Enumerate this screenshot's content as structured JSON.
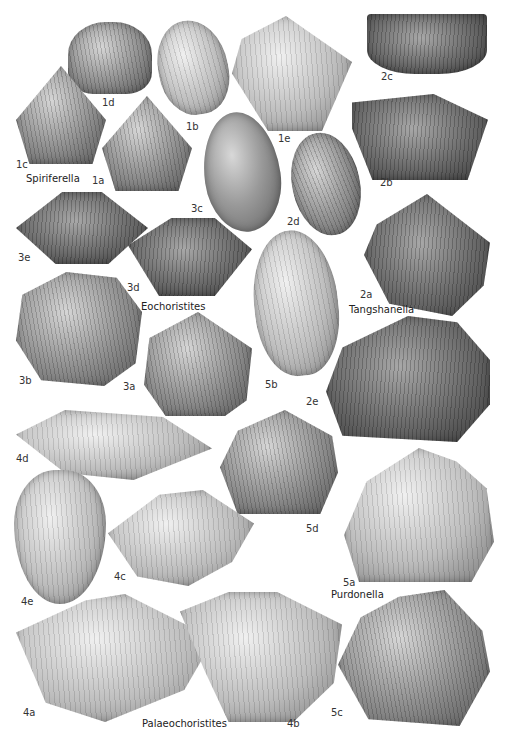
{
  "plate": {
    "background": "#ffffff",
    "genera": {
      "spiriferella": "Spiriferella",
      "eochoristites": "Eochoristites",
      "tangshanella": "Tangshanella",
      "purdonella": "Purdonella",
      "palaeochoristites": "Palaeochoristites"
    },
    "figures": {
      "1a": "1a",
      "1b": "1b",
      "1c": "1c",
      "1d": "1d",
      "1e": "1e",
      "2a": "2a",
      "2b": "2b",
      "2c": "2c",
      "2d": "2d",
      "2e": "2e",
      "3a": "3a",
      "3b": "3b",
      "3c": "3c",
      "3d": "3d",
      "3e": "3e",
      "4a": "4a",
      "4b": "4b",
      "4c": "4c",
      "4d": "4d",
      "4e": "4e",
      "5a": "5a",
      "5b": "5b",
      "5c": "5c",
      "5d": "5d"
    }
  }
}
